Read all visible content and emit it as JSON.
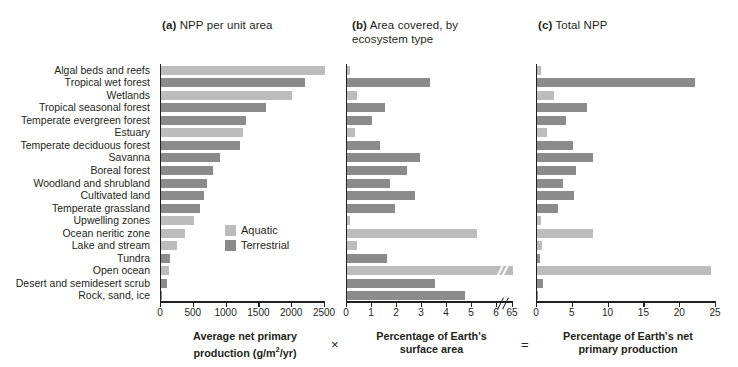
{
  "figure": {
    "operators": {
      "times": "×",
      "equals": "="
    }
  },
  "legend": {
    "position": "inside-panel-a",
    "items": [
      {
        "label": "Aquatic",
        "color": "#bcbcbc",
        "key": "aquatic"
      },
      {
        "label": "Terrestrial",
        "color": "#8b8b8b",
        "key": "terrestrial"
      }
    ]
  },
  "panels": {
    "a": {
      "tag": "(a)",
      "title": "NPP per unit area"
    },
    "b": {
      "tag": "(b)",
      "title": "Area covered, by ecosystem type"
    },
    "c": {
      "tag": "(c)",
      "title": "Total NPP"
    }
  },
  "categories": [
    "Algal beds and reefs",
    "Tropical wet forest",
    "Wetlands",
    "Tropical seasonal forest",
    "Temperate evergreen forest",
    "Estuary",
    "Temperate deciduous forest",
    "Savanna",
    "Boreal forest",
    "Woodland and shrubland",
    "Cultivated land",
    "Temperate grassland",
    "Upwelling zones",
    "Ocean neritic zone",
    "Lake and stream",
    "Tundra",
    "Open ocean",
    "Desert and semidesert scrub",
    "Rock, sand, ice"
  ],
  "types": [
    "aquatic",
    "terrestrial",
    "aquatic",
    "terrestrial",
    "terrestrial",
    "aquatic",
    "terrestrial",
    "terrestrial",
    "terrestrial",
    "terrestrial",
    "terrestrial",
    "terrestrial",
    "aquatic",
    "aquatic",
    "aquatic",
    "terrestrial",
    "aquatic",
    "terrestrial",
    "terrestrial"
  ],
  "chart_data": [
    {
      "type": "bar",
      "orientation": "horizontal",
      "panel": "a",
      "title": "(a) NPP per unit area",
      "xlabel": "Average net primary production (g/m2/yr)",
      "ylabel": "",
      "xlim": [
        0,
        2500
      ],
      "xticks": [
        0,
        500,
        1000,
        1500,
        2000,
        2500
      ],
      "grid": false,
      "categories": [
        "Algal beds and reefs",
        "Tropical wet forest",
        "Wetlands",
        "Tropical seasonal forest",
        "Temperate evergreen forest",
        "Estuary",
        "Temperate deciduous forest",
        "Savanna",
        "Boreal forest",
        "Woodland and shrubland",
        "Cultivated land",
        "Temperate grassland",
        "Upwelling zones",
        "Ocean neritic zone",
        "Lake and stream",
        "Tundra",
        "Open ocean",
        "Desert and semidesert scrub",
        "Rock, sand, ice"
      ],
      "values": [
        2500,
        2200,
        2000,
        1600,
        1300,
        1250,
        1200,
        900,
        800,
        700,
        650,
        600,
        500,
        360,
        250,
        140,
        125,
        90,
        3
      ]
    },
    {
      "type": "bar",
      "orientation": "horizontal",
      "panel": "b",
      "title": "(b) Area covered, by ecosystem type",
      "xlabel": "Percentage of Earth's surface area",
      "ylabel": "",
      "xlim": [
        0,
        6
      ],
      "xticks": [
        0,
        1,
        2,
        3,
        4,
        5,
        6,
        65
      ],
      "axis_break": {
        "after": 6,
        "then": 65
      },
      "grid": false,
      "categories": [
        "Algal beds and reefs",
        "Tropical wet forest",
        "Wetlands",
        "Tropical seasonal forest",
        "Temperate evergreen forest",
        "Estuary",
        "Temperate deciduous forest",
        "Savanna",
        "Boreal forest",
        "Woodland and shrubland",
        "Cultivated land",
        "Temperate grassland",
        "Upwelling zones",
        "Ocean neritic zone",
        "Lake and stream",
        "Tundra",
        "Open ocean",
        "Desert and semidesert scrub",
        "Rock, sand, ice"
      ],
      "values": [
        0.1,
        3.3,
        0.4,
        1.5,
        1.0,
        0.3,
        1.3,
        2.9,
        2.4,
        1.7,
        2.7,
        1.9,
        0.1,
        5.2,
        0.4,
        1.6,
        65.0,
        3.5,
        4.7
      ]
    },
    {
      "type": "bar",
      "orientation": "horizontal",
      "panel": "c",
      "title": "(c) Total NPP",
      "xlabel": "Percentage of Earth's net primary production",
      "ylabel": "",
      "xlim": [
        0,
        25
      ],
      "xticks": [
        0,
        5,
        10,
        15,
        20,
        25
      ],
      "grid": false,
      "categories": [
        "Algal beds and reefs",
        "Tropical wet forest",
        "Wetlands",
        "Tropical seasonal forest",
        "Temperate evergreen forest",
        "Estuary",
        "Temperate deciduous forest",
        "Savanna",
        "Boreal forest",
        "Woodland and shrubland",
        "Cultivated land",
        "Temperate grassland",
        "Upwelling zones",
        "Ocean neritic zone",
        "Lake and stream",
        "Tundra",
        "Open ocean",
        "Desert and semidesert scrub",
        "Rock, sand, ice"
      ],
      "values": [
        0.6,
        22.0,
        2.4,
        7.0,
        4.0,
        1.4,
        5.0,
        7.8,
        5.5,
        3.6,
        5.2,
        3.0,
        0.5,
        7.8,
        0.7,
        0.4,
        24.3,
        0.8,
        0.1
      ]
    }
  ],
  "axis_titles": {
    "a_line1": "Average net primary",
    "a_line2_pre": "production (g/m",
    "a_line2_sup": "2",
    "a_line2_post": "/yr)",
    "b_line1": "Percentage of Earth's",
    "b_line2": "surface area",
    "c_line1": "Percentage of Earth's net",
    "c_line2": "primary production"
  },
  "ticks": {
    "a": [
      "0",
      "500",
      "1000",
      "1500",
      "2000",
      "2500"
    ],
    "b": [
      "0",
      "1",
      "2",
      "3",
      "4",
      "5",
      "6",
      "65"
    ],
    "c": [
      "0",
      "5",
      "10",
      "15",
      "20",
      "25"
    ]
  }
}
